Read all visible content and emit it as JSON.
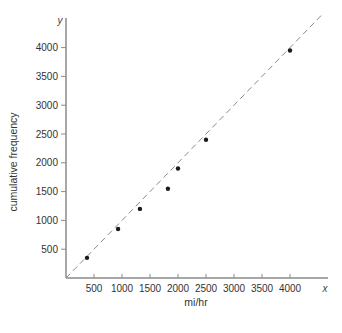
{
  "chart_data": {
    "type": "scatter",
    "title": "",
    "xlabel": "mi/hr",
    "ylabel": "cumulative frequency",
    "x_axis_var": "x",
    "y_axis_var": "y",
    "xlim": [
      0,
      4500
    ],
    "ylim": [
      0,
      4300
    ],
    "x_ticks": [
      500,
      1000,
      1500,
      2000,
      2500,
      3000,
      3500,
      4000
    ],
    "y_ticks": [
      500,
      1000,
      1500,
      2000,
      2500,
      3000,
      3500,
      4000
    ],
    "grid": false,
    "legend": null,
    "series": [
      {
        "name": "observations",
        "points": [
          {
            "x": 375,
            "y": 350
          },
          {
            "x": 930,
            "y": 850
          },
          {
            "x": 1320,
            "y": 1200
          },
          {
            "x": 1820,
            "y": 1550
          },
          {
            "x": 2000,
            "y": 1900
          },
          {
            "x": 2500,
            "y": 2400
          },
          {
            "x": 4000,
            "y": 3950
          }
        ]
      }
    ],
    "reference_line": {
      "style": "dashed",
      "equation": "y = x",
      "from": [
        0,
        0
      ],
      "to": [
        4600,
        4600
      ]
    }
  },
  "colors": {
    "axis": "#8a8a8a",
    "points": "#1a1a1a",
    "reference_line": "#8a8a8a",
    "text": "#333333"
  }
}
